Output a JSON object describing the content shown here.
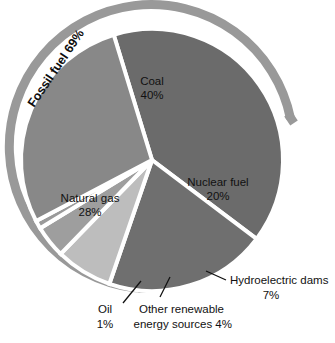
{
  "chart_data": {
    "type": "pie",
    "title": "",
    "subtitle": "",
    "xlabel": "",
    "ylabel": "",
    "legend_position": "none",
    "grid": false,
    "units": "percent",
    "categories": [
      "Coal",
      "Nuclear fuel",
      "Hydroelectric dams",
      "Other renewable energy sources",
      "Oil",
      "Natural gas"
    ],
    "values": [
      40,
      20,
      7,
      4,
      1,
      28
    ],
    "slices": [
      {
        "name": "Coal",
        "label_line1": "Coal",
        "label_line2": "40%",
        "value": 40,
        "color": "#6b6b6b",
        "label_type": "inside",
        "label_x": 152,
        "label_y": 82
      },
      {
        "name": "Nuclear fuel",
        "label_line1": "Nuclear fuel",
        "label_line2": "20%",
        "value": 20,
        "color": "#6f6f6f",
        "label_type": "inside",
        "label_x": 216,
        "label_y": 183
      },
      {
        "name": "Hydroelectric dams",
        "label_line1": "Hydroelectric dams",
        "label_line2": "7%",
        "value": 7,
        "color": "#bdbdbd",
        "label_type": "callout",
        "label_x": 228,
        "label_y": 276
      },
      {
        "name": "Other renewable energy sources",
        "label_line1": "Other renewable",
        "label_line2": "energy sources 4%",
        "value": 4,
        "color": "#9e9e9e",
        "label_type": "callout",
        "label_x": 161,
        "label_y": 310
      },
      {
        "name": "Oil",
        "label_line1": "Oil",
        "label_line2": "1%",
        "value": 1,
        "color": "#9a9a9a",
        "label_type": "callout",
        "label_x": 101,
        "label_y": 310
      },
      {
        "name": "Natural gas",
        "label_line1": "Natural gas",
        "label_line2": "28%",
        "value": 28,
        "color": "#888888",
        "label_type": "inside",
        "label_x": 90,
        "label_y": 199
      }
    ],
    "annotations": [
      {
        "name": "fossil-fuel-bracket",
        "text": "Fossil fuel 69%",
        "value": 69,
        "covers": [
          "Coal",
          "Natural gas",
          "Oil"
        ],
        "color": "#999999",
        "style": "outer-arc-bracket"
      }
    ],
    "colors": {
      "background": "#ffffff",
      "slice_separator": "#ffffff",
      "text": "#111111",
      "bracket": "#999999"
    }
  }
}
